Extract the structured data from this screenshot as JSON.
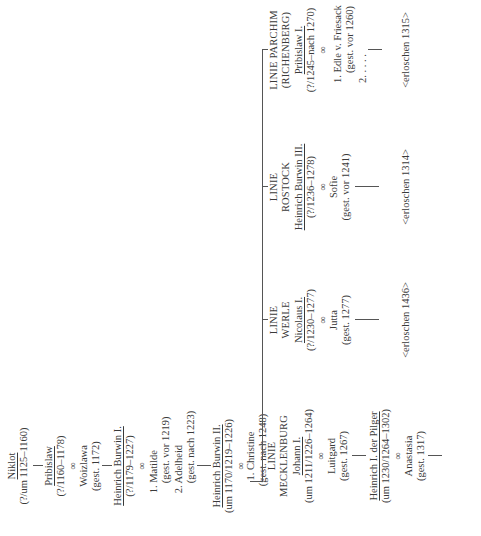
{
  "orientation": "rotated -90deg (text reads bottom to top)",
  "ancestors": [
    {
      "name": "Niklot",
      "dates": "(?/um 1125–1160)"
    },
    {
      "name": "Pribislaw",
      "dates": "(?/1160–1178)",
      "marriage_symbol": "∞",
      "spouse": "Woizlawa",
      "spouse_dates": "(gest. 1172)"
    },
    {
      "name": "Heinrich Burwin I.",
      "dates": "(?/1179–1227)",
      "marriage_symbol": "∞",
      "spouses": [
        {
          "name": "1. Matilde",
          "dates": "(gest. vor 1219)"
        },
        {
          "name": "2. Adelheid",
          "dates": "(gest. nach 1223)"
        }
      ]
    },
    {
      "name": "Heinrich Burwin II.",
      "dates": "(um 1170/1219–1226)",
      "marriage_symbol": "∞",
      "spouse": "1. Christine",
      "spouse_dates": "(gest. nach 1248)"
    }
  ],
  "lines": [
    {
      "line_label": [
        "LINIE",
        "MECKLENBURG"
      ],
      "name": "Johann I.",
      "dates": "(um 1211/1226–1264)",
      "marriage_symbol": "∞",
      "spouse": "Luitgard",
      "spouse_dates": "(gest. 1267)",
      "child": {
        "name": "Heinrich I. der Pilger",
        "dates": "(um 1230/1264–1302)",
        "marriage_symbol": "∞",
        "spouse": "Anastasia",
        "spouse_dates": "(gest. 1317)"
      }
    },
    {
      "line_label": [
        "LINIE",
        "WERLE"
      ],
      "name": "Nicolaus I.",
      "dates": "(?/1230–1277)",
      "marriage_symbol": "∞",
      "spouse": "Jutta",
      "spouse_dates": "(gest. 1277)",
      "extinct": "<erloschen 1436>"
    },
    {
      "line_label": [
        "LINIE",
        "ROSTOCK"
      ],
      "name": "Heinrich Burwin III.",
      "dates": "(?/1236–1278)",
      "marriage_symbol": "∞",
      "spouse": "Sofie",
      "spouse_dates": "(gest. vor 1241)",
      "extinct": "<erloschen 1314>"
    },
    {
      "line_label": [
        "LINIE PARCHIM",
        "(RICHENBERG)"
      ],
      "name": "Pribislaw I.",
      "dates": "(?/1245–nach 1270)",
      "marriage_symbol": "∞",
      "spouses": [
        {
          "name": "1. Edle v. Friesack",
          "dates": "(gest. vor 1260)"
        },
        {
          "name": "2. . . . .",
          "dates": ""
        }
      ],
      "extinct": "<erloschen 1315>"
    }
  ]
}
